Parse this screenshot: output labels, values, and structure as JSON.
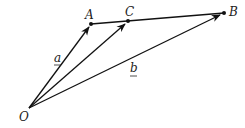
{
  "diagram": {
    "type": "vector-diagram",
    "points": {
      "O": {
        "label": "O",
        "x": 29,
        "y": 108
      },
      "A": {
        "label": "A",
        "x": 91,
        "y": 24
      },
      "C": {
        "label": "C",
        "x": 128,
        "y": 21
      },
      "B": {
        "label": "B",
        "x": 224,
        "y": 13
      }
    },
    "vector_labels": {
      "a": "a",
      "b": "b"
    },
    "colors": {
      "stroke": "#111111",
      "text": "#222222"
    }
  }
}
